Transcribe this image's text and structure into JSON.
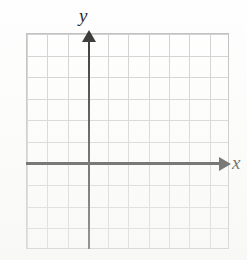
{
  "figure": {
    "kind": "blank-coordinate-grid"
  },
  "labels": {
    "x_axis": "x",
    "y_axis": "y"
  },
  "colors": {
    "axis": "#2b2b2b",
    "grid_line": "#cfcfcf",
    "grid_border": "#bdbdbd",
    "background": "#ffffff",
    "label_text": "#1f1f1f"
  },
  "chart_data": {
    "type": "scatter",
    "title": "",
    "xlabel": "x",
    "ylabel": "y",
    "x": [],
    "y": [],
    "series": [],
    "annotations": [],
    "grid": true,
    "legend": false,
    "xlim": [
      -3,
      7
    ],
    "ylim": [
      -4,
      6
    ],
    "xticks": [
      -3,
      -2,
      -1,
      0,
      1,
      2,
      3,
      4,
      5,
      6,
      7
    ],
    "yticks": [
      -4,
      -3,
      -2,
      -1,
      0,
      1,
      2,
      3,
      4,
      5,
      6
    ],
    "xtick_labels": [],
    "ytick_labels": [],
    "grid_columns": 10,
    "grid_rows": 10,
    "origin_column_index": 3,
    "origin_row_index": 6
  }
}
